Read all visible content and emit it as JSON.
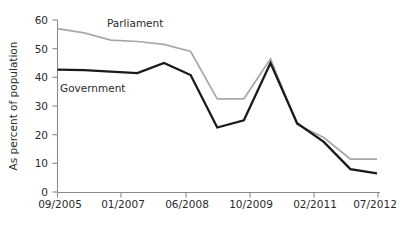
{
  "chart_data": {
    "type": "line",
    "title": "",
    "xlabel": "",
    "ylabel": "As percent of population",
    "ylim": [
      0,
      60
    ],
    "yticks": [
      0,
      10,
      20,
      30,
      40,
      50,
      60
    ],
    "x": [
      "09/2005",
      "11/2005",
      "04/2006",
      "01/2007",
      "11/2007",
      "06/2008",
      "01/2009",
      "10/2009",
      "01/2010",
      "06/2010",
      "02/2011",
      "10/2011",
      "07/2012"
    ],
    "xticks": [
      "09/2005",
      "01/2007",
      "06/2008",
      "10/2009",
      "02/2011",
      "07/2012"
    ],
    "xtick_positions": [
      0,
      3,
      5,
      7,
      10,
      12
    ],
    "grid": false,
    "legend": "inline-annotations",
    "series": [
      {
        "name": "Parliament",
        "color": "#a8a8a8",
        "values": [
          57.0,
          55.5,
          53.0,
          52.5,
          51.5,
          49.0,
          32.5,
          32.5,
          46.5,
          23.5,
          19.0,
          11.5,
          11.5
        ]
      },
      {
        "name": "Government",
        "color": "#1a1a1a",
        "values": [
          42.7,
          42.5,
          42.0,
          41.5,
          45.0,
          40.8,
          22.5,
          25.0,
          45.0,
          24.0,
          17.5,
          8.0,
          6.5
        ]
      }
    ],
    "annotations": [
      {
        "text": "Parliament",
        "series": "Parliament"
      },
      {
        "text": "Government",
        "series": "Government"
      }
    ]
  },
  "axis": {
    "y_title": "As percent of population",
    "y_tick_labels": [
      "60",
      "50",
      "40",
      "30",
      "20",
      "10",
      "0"
    ],
    "x_tick_labels": [
      "09/2005",
      "01/2007",
      "06/2008",
      "10/2009",
      "02/2011",
      "07/2012"
    ]
  },
  "labels": {
    "parliament": "Parliament",
    "government": "Government"
  },
  "colors": {
    "parliament_line": "#a8a8a8",
    "government_line": "#1a1a1a",
    "axis": "#8a8a8a",
    "text": "#2b2b2b",
    "background": "#ffffff"
  }
}
